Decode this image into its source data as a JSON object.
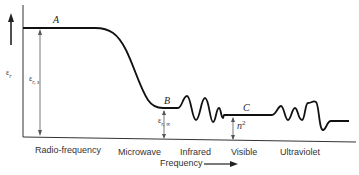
{
  "diagram": {
    "title": "",
    "y_axis": {
      "label": "ε_r",
      "label_main": "ε",
      "label_sub": "r"
    },
    "x_axis": {
      "label": "Frequency",
      "arrow": "right-arrow"
    },
    "regions": [
      {
        "label": "Radio-frequency"
      },
      {
        "label": "Microwave"
      },
      {
        "label": "Infrared"
      },
      {
        "label": "Visible"
      },
      {
        "label": "Ultraviolet"
      }
    ],
    "points": {
      "A": "A",
      "B": "B",
      "C": "C"
    },
    "annotations": {
      "static": {
        "main": "ε",
        "sub": "r, s"
      },
      "infinite": {
        "main": "ε",
        "sub": "r, ∞"
      },
      "optical": {
        "main": "n",
        "sup": "2"
      }
    },
    "colors": {
      "line": "#111111",
      "axis": "#333333",
      "arrow": "#555555"
    }
  }
}
